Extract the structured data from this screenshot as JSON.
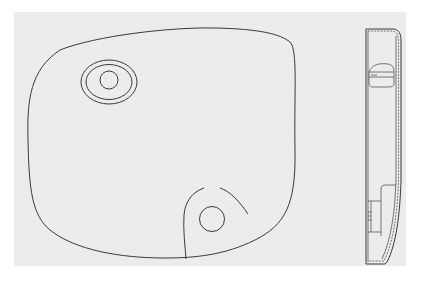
{
  "figure": {
    "views": [
      {
        "name": "front-view",
        "features": [
          "outer-outline",
          "top-left-oval-boss",
          "bottom-right-circular-opening",
          "bottom-right-cutout-arc"
        ]
      },
      {
        "name": "side-view",
        "features": [
          "housing-profile",
          "upper-clip",
          "lower-mount-block",
          "hatched-shell-wall"
        ]
      }
    ],
    "colors": {
      "background": "#ececec",
      "line": "#3a3a3a"
    }
  }
}
